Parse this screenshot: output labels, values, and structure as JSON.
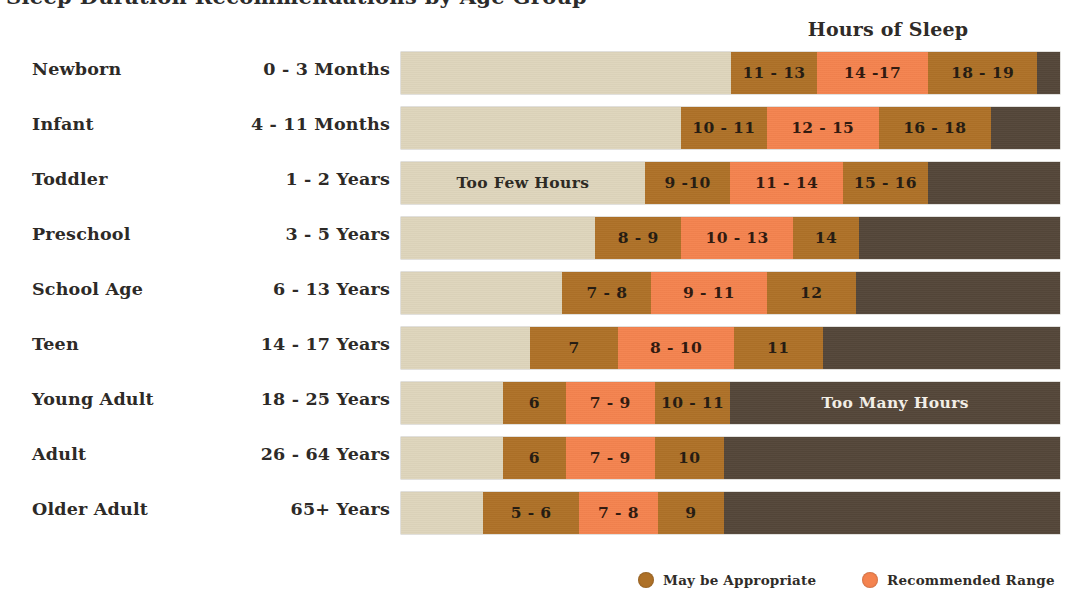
{
  "title": "Sleep Duration Recommendations by Age Group",
  "axis_caption": "Hours of Sleep",
  "colors": {
    "too_few": "#DED5BC",
    "may_be_appropriate": "#AE7128",
    "recommended_range": "#F4834F",
    "too_many": "#544639",
    "text": "#2D2A27"
  },
  "legend": {
    "items": [
      {
        "label": "May be Appropriate",
        "color": "#AE7128",
        "dot": "legend-dot-brown"
      },
      {
        "label": "Recommended Range",
        "color": "#F4834F",
        "dot": "legend-dot-orange"
      }
    ]
  },
  "band_labels": {
    "too_few": "Too Few Hours",
    "too_many": "Too Many Hours"
  },
  "rows": [
    {
      "name": "Newborn",
      "age": "0 - 3  Months",
      "segments": [
        {
          "kind": "few",
          "label": "",
          "pct": 50.1
        },
        {
          "kind": "maybe",
          "label": "11 - 13",
          "pct": 13.0
        },
        {
          "kind": "rec",
          "label": "14 -17",
          "pct": 16.9
        },
        {
          "kind": "maybe",
          "label": "18 - 19",
          "pct": 16.5
        },
        {
          "kind": "many",
          "label": "",
          "pct": 3.5
        }
      ]
    },
    {
      "name": "Infant",
      "age": "4 - 11  Months",
      "segments": [
        {
          "kind": "few",
          "label": "",
          "pct": 42.5
        },
        {
          "kind": "maybe",
          "label": "10 - 11",
          "pct": 13.0
        },
        {
          "kind": "rec",
          "label": "12 - 15",
          "pct": 17.0
        },
        {
          "kind": "maybe",
          "label": "16 - 18",
          "pct": 17.0
        },
        {
          "kind": "many",
          "label": "",
          "pct": 10.5
        }
      ]
    },
    {
      "name": "Toddler",
      "age": "1 - 2  Years",
      "segments": [
        {
          "kind": "few",
          "label": "Too Few Hours",
          "pct": 37.0
        },
        {
          "kind": "maybe",
          "label": "9 -10",
          "pct": 13.0
        },
        {
          "kind": "rec",
          "label": "11 - 14",
          "pct": 17.0
        },
        {
          "kind": "maybe",
          "label": "15 - 16",
          "pct": 13.0
        },
        {
          "kind": "many",
          "label": "",
          "pct": 20.0
        }
      ]
    },
    {
      "name": "Preschool",
      "age": "3 - 5  Years",
      "segments": [
        {
          "kind": "few",
          "label": "",
          "pct": 29.5
        },
        {
          "kind": "maybe",
          "label": "8 - 9",
          "pct": 13.0
        },
        {
          "kind": "rec",
          "label": "10 - 13",
          "pct": 17.0
        },
        {
          "kind": "maybe",
          "label": "14",
          "pct": 10.0
        },
        {
          "kind": "many",
          "label": "",
          "pct": 30.5
        }
      ]
    },
    {
      "name": "School Age",
      "age": "6 - 13  Years",
      "segments": [
        {
          "kind": "few",
          "label": "",
          "pct": 24.5
        },
        {
          "kind": "maybe",
          "label": "7 - 8",
          "pct": 13.5
        },
        {
          "kind": "rec",
          "label": "9 - 11",
          "pct": 17.5
        },
        {
          "kind": "maybe",
          "label": "12",
          "pct": 13.5
        },
        {
          "kind": "many",
          "label": "",
          "pct": 31.0
        }
      ]
    },
    {
      "name": "Teen",
      "age": "14 - 17  Years",
      "segments": [
        {
          "kind": "few",
          "label": "",
          "pct": 19.5
        },
        {
          "kind": "maybe",
          "label": "7",
          "pct": 13.5
        },
        {
          "kind": "rec",
          "label": "8 - 10",
          "pct": 17.5
        },
        {
          "kind": "maybe",
          "label": "11",
          "pct": 13.5
        },
        {
          "kind": "many",
          "label": "",
          "pct": 36.0
        }
      ]
    },
    {
      "name": "Young Adult",
      "age": "18 - 25  Years",
      "segments": [
        {
          "kind": "few",
          "label": "",
          "pct": 15.5
        },
        {
          "kind": "maybe",
          "label": "6",
          "pct": 9.5
        },
        {
          "kind": "rec",
          "label": "7 - 9",
          "pct": 13.5
        },
        {
          "kind": "maybe",
          "label": "10 - 11",
          "pct": 11.5
        },
        {
          "kind": "many",
          "label": "Too Many Hours",
          "pct": 50.0
        }
      ]
    },
    {
      "name": "Adult",
      "age": "26 - 64  Years",
      "segments": [
        {
          "kind": "few",
          "label": "",
          "pct": 15.5
        },
        {
          "kind": "maybe",
          "label": "6",
          "pct": 9.5
        },
        {
          "kind": "rec",
          "label": "7 - 9",
          "pct": 13.5
        },
        {
          "kind": "maybe",
          "label": "10",
          "pct": 10.5
        },
        {
          "kind": "many",
          "label": "",
          "pct": 51.0
        }
      ]
    },
    {
      "name": "Older Adult",
      "age": "65+  Years",
      "segments": [
        {
          "kind": "few",
          "label": "",
          "pct": 12.5
        },
        {
          "kind": "maybe",
          "label": "5 - 6",
          "pct": 14.5
        },
        {
          "kind": "rec",
          "label": "7 - 8",
          "pct": 12.0
        },
        {
          "kind": "maybe",
          "label": "9",
          "pct": 10.0
        },
        {
          "kind": "many",
          "label": "",
          "pct": 51.0
        }
      ]
    }
  ],
  "chart_data": {
    "type": "bar",
    "title": "Sleep Duration Recommendations by Age Group",
    "subtitle": "",
    "xlabel": "Hours of Sleep",
    "ylabel": "",
    "orientation": "horizontal",
    "stacked": true,
    "grid": false,
    "legend_position": "bottom",
    "xlim": [
      0,
      24
    ],
    "categories": [
      "Newborn",
      "Infant",
      "Toddler",
      "Preschool",
      "School Age",
      "Teen",
      "Young Adult",
      "Adult",
      "Older Adult"
    ],
    "age_ranges": [
      "0 - 3 Months",
      "4 - 11 Months",
      "1 - 2 Years",
      "3 - 5 Years",
      "6 - 13 Years",
      "14 - 17 Years",
      "18 - 25 Years",
      "26 - 64 Years",
      "65+ Years"
    ],
    "legend_entries": [
      "May be Appropriate",
      "Recommended Range"
    ],
    "band_annotations": [
      "Too Few Hours",
      "Too Many Hours"
    ],
    "series": [
      {
        "name": "May be Appropriate (low)",
        "color": "#AE7128",
        "labels": [
          "11 - 13",
          "10 - 11",
          "9 -10",
          "8 - 9",
          "7 - 8",
          "7",
          "6",
          "6",
          "5 - 6"
        ],
        "ranges": [
          [
            11,
            13
          ],
          [
            10,
            11
          ],
          [
            9,
            10
          ],
          [
            8,
            9
          ],
          [
            7,
            8
          ],
          [
            7,
            7
          ],
          [
            6,
            6
          ],
          [
            6,
            6
          ],
          [
            5,
            6
          ]
        ]
      },
      {
        "name": "Recommended Range",
        "color": "#F4834F",
        "labels": [
          "14 -17",
          "12 - 15",
          "11 - 14",
          "10 - 13",
          "9 - 11",
          "8 - 10",
          "7 - 9",
          "7 - 9",
          "7 - 8"
        ],
        "ranges": [
          [
            14,
            17
          ],
          [
            12,
            15
          ],
          [
            11,
            14
          ],
          [
            10,
            13
          ],
          [
            9,
            11
          ],
          [
            8,
            10
          ],
          [
            7,
            9
          ],
          [
            7,
            9
          ],
          [
            7,
            8
          ]
        ]
      },
      {
        "name": "May be Appropriate (high)",
        "color": "#AE7128",
        "labels": [
          "18 - 19",
          "16 - 18",
          "15 - 16",
          "14",
          "12",
          "11",
          "10 - 11",
          "10",
          "9"
        ],
        "ranges": [
          [
            18,
            19
          ],
          [
            16,
            18
          ],
          [
            15,
            16
          ],
          [
            14,
            14
          ],
          [
            12,
            12
          ],
          [
            11,
            11
          ],
          [
            10,
            11
          ],
          [
            10,
            10
          ],
          [
            9,
            9
          ]
        ]
      }
    ]
  }
}
